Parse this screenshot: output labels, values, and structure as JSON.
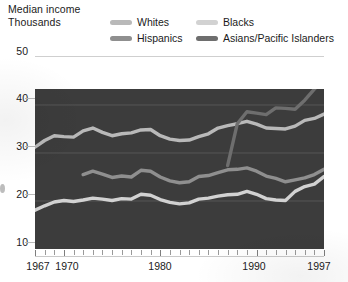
{
  "header": {
    "title_line1": "Median income",
    "title_line2": "Thousands"
  },
  "legend": {
    "items": [
      {
        "label": "Whites",
        "color": "#b9b9b9"
      },
      {
        "label": "Blacks",
        "color": "#d2d2d2"
      },
      {
        "label": "Hispanics",
        "color": "#8f8f8f"
      },
      {
        "label": "Asians/Pacific Islanders",
        "color": "#6e6e6e"
      }
    ]
  },
  "chart_data": {
    "type": "line",
    "title": "Median income",
    "subtitle": "Thousands",
    "xlabel": "",
    "ylabel": "Thousands",
    "xlim": [
      1967,
      1997
    ],
    "ylim": [
      10,
      50
    ],
    "yticks": [
      10,
      20,
      30,
      40,
      50
    ],
    "ytick_labels": [
      "10",
      "20",
      "30",
      "40",
      "50"
    ],
    "xticks": [
      1967,
      1970,
      1980,
      1990,
      1997
    ],
    "xtick_labels": [
      "1967",
      "1970",
      "1980",
      "1990",
      "1997"
    ],
    "grid": true,
    "grid_axis": "y",
    "legend_position": "top",
    "plot_background": "#3c3c3c",
    "series": [
      {
        "name": "Whites",
        "color": "#b9b9b9",
        "x": [
          1967,
          1968,
          1969,
          1970,
          1971,
          1972,
          1973,
          1974,
          1975,
          1976,
          1977,
          1978,
          1979,
          1980,
          1981,
          1982,
          1983,
          1984,
          1985,
          1986,
          1987,
          1988,
          1989,
          1990,
          1991,
          1992,
          1993,
          1994,
          1995,
          1996,
          1997
        ],
        "values": [
          31.2,
          32.6,
          33.6,
          33.4,
          33.3,
          34.6,
          35.2,
          34.3,
          33.6,
          34.0,
          34.2,
          34.8,
          34.9,
          33.6,
          32.9,
          32.6,
          32.7,
          33.4,
          34.0,
          35.2,
          35.7,
          36.1,
          36.6,
          36.0,
          35.2,
          35.1,
          35.0,
          35.6,
          36.8,
          37.2,
          38.1
        ]
      },
      {
        "name": "Blacks",
        "color": "#d2d2d2",
        "x": [
          1967,
          1968,
          1969,
          1970,
          1971,
          1972,
          1973,
          1974,
          1975,
          1976,
          1977,
          1978,
          1979,
          1980,
          1981,
          1982,
          1983,
          1984,
          1985,
          1986,
          1987,
          1988,
          1989,
          1990,
          1991,
          1992,
          1993,
          1994,
          1995,
          1996,
          1997
        ],
        "values": [
          18.1,
          19.0,
          19.8,
          20.1,
          19.9,
          20.2,
          20.6,
          20.4,
          20.1,
          20.5,
          20.4,
          21.4,
          21.2,
          20.3,
          19.7,
          19.4,
          19.6,
          20.4,
          20.6,
          21.0,
          21.3,
          21.4,
          22.0,
          21.4,
          20.5,
          20.2,
          20.1,
          22.0,
          23.0,
          23.5,
          25.1
        ]
      },
      {
        "name": "Hispanics",
        "color": "#8f8f8f",
        "x": [
          1972,
          1973,
          1974,
          1975,
          1976,
          1977,
          1978,
          1979,
          1980,
          1981,
          1982,
          1983,
          1984,
          1985,
          1986,
          1987,
          1988,
          1989,
          1990,
          1991,
          1992,
          1993,
          1994,
          1995,
          1996,
          1997
        ],
        "values": [
          25.5,
          26.2,
          25.6,
          24.9,
          25.2,
          25.0,
          26.4,
          26.2,
          25.0,
          24.2,
          23.8,
          24.0,
          25.1,
          25.3,
          25.9,
          26.5,
          26.6,
          26.9,
          26.2,
          25.2,
          24.7,
          24.0,
          24.4,
          24.8,
          25.5,
          26.6
        ]
      },
      {
        "name": "Asians/Pacific Islanders",
        "color": "#6e6e6e",
        "x": [
          1987,
          1988,
          1989,
          1990,
          1991,
          1992,
          1993,
          1994,
          1995,
          1996,
          1997
        ],
        "values": [
          27.4,
          36.1,
          38.6,
          38.3,
          38.0,
          39.4,
          39.3,
          39.1,
          41.0,
          43.3,
          45.2
        ]
      }
    ]
  }
}
